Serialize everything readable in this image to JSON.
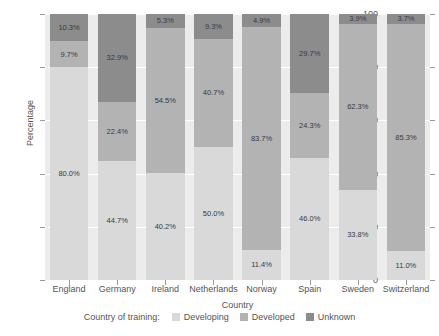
{
  "chart_data": {
    "type": "bar",
    "subtype": "stacked-bar-100",
    "title": "",
    "xlabel": "Country",
    "ylabel": "Percentage",
    "ylim": [
      0,
      100
    ],
    "yticks": [
      0,
      20,
      40,
      60,
      80,
      100
    ],
    "ytick_labels": [
      "0",
      "20",
      "40",
      "60",
      "80",
      "100"
    ],
    "grid": true,
    "legend_position": "bottom",
    "legend_title": "Country of training:",
    "categories": [
      "England",
      "Germany",
      "Ireland",
      "Netherlands",
      "Norway",
      "Spain",
      "Sweden",
      "Switzerland"
    ],
    "series": [
      {
        "name": "Developing",
        "color": "#d9d9d9",
        "values": [
          80.0,
          44.7,
          40.2,
          50.0,
          11.4,
          46.0,
          33.8,
          11.0
        ],
        "labels": [
          "80.0%",
          "44.7%",
          "40.2%",
          "50.0%",
          "11.4%",
          "46.0%",
          "33.8%",
          "11.0%"
        ]
      },
      {
        "name": "Developed",
        "color": "#b3b3b3",
        "values": [
          9.7,
          22.4,
          54.5,
          40.7,
          83.7,
          24.3,
          62.3,
          85.3
        ],
        "labels": [
          "9.7%",
          "22.4%",
          "54.5%",
          "40.7%",
          "83.7%",
          "24.3%",
          "62.3%",
          "85.3%"
        ]
      },
      {
        "name": "Unknown",
        "color": "#8c8c8c",
        "values": [
          10.3,
          32.9,
          5.3,
          9.3,
          4.9,
          29.7,
          3.9,
          3.7
        ],
        "labels": [
          "10.3%",
          "32.9%",
          "5.3%",
          "9.3%",
          "4.9%",
          "29.7%",
          "3.9%",
          "3.7%"
        ]
      }
    ]
  }
}
